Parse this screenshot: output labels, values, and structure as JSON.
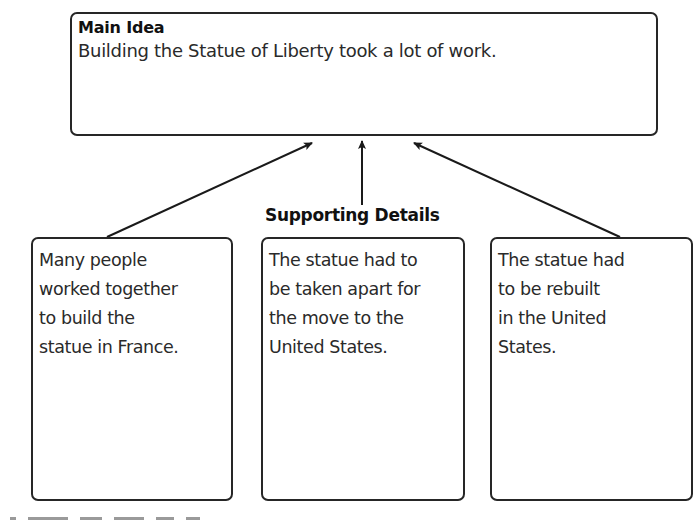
{
  "diagram": {
    "type": "main-idea-and-details graphic organizer",
    "main_idea": {
      "heading": "Main Idea",
      "text": "Building the Statue of Liberty took a lot of work."
    },
    "supporting_details_label": "Supporting Details",
    "details": [
      {
        "lines": [
          "Many people",
          "worked together",
          "to build the",
          "statue in France."
        ]
      },
      {
        "lines": [
          "The statue had to",
          "be taken apart for",
          "the move to the",
          "United States."
        ]
      },
      {
        "lines": [
          "The statue had",
          "to be rebuilt",
          "in the United",
          "States."
        ]
      }
    ],
    "connections": [
      {
        "from": "details.0",
        "to": "main_idea"
      },
      {
        "from": "supporting_details_label",
        "to": "main_idea"
      },
      {
        "from": "details.2",
        "to": "main_idea"
      }
    ],
    "colors": {
      "stroke": "#262626",
      "text": "#2a2a2a",
      "background": "#ffffff"
    }
  }
}
